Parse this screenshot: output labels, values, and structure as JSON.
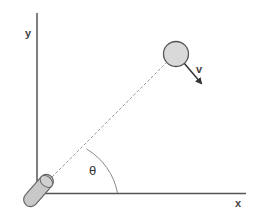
{
  "diagram": {
    "labels": {
      "y_axis": "y",
      "x_axis": "x",
      "velocity": "v",
      "angle": "θ"
    },
    "colors": {
      "axis": "#555555",
      "ball_fill": "#d9d9d9",
      "ball_stroke": "#555555",
      "cannon_fill": "#c8c8c8",
      "cannon_stroke": "#666666",
      "dashed_line": "#999999",
      "arc": "#777777",
      "arrow": "#333333"
    },
    "elements": {
      "y_axis": "vertical axis",
      "x_axis": "horizontal axis",
      "cannon": "launcher",
      "trajectory": "dashed line-of-sight",
      "ball": "target",
      "velocity_arrow": "velocity vector",
      "angle_arc": "launch angle"
    }
  }
}
